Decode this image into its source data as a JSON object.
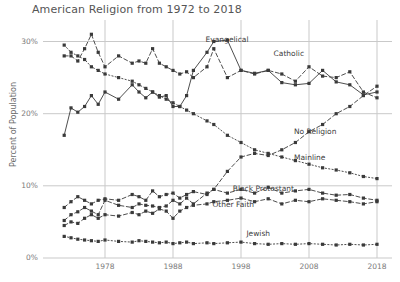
{
  "chart_data": {
    "type": "line",
    "title": "American Religion from 1972 to 2018",
    "xlabel": "",
    "ylabel": "Percent of Population",
    "xlim": [
      1972,
      2018
    ],
    "ylim": [
      0,
      32
    ],
    "grid": true,
    "legend_position": "inline-annotations",
    "yticks": [
      "0%",
      "10%",
      "20%",
      "30%"
    ],
    "ytick_values": [
      0,
      10,
      20,
      30
    ],
    "xticks": [
      "1978",
      "1988",
      "1998",
      "2008",
      "2018"
    ],
    "xtick_values": [
      1978,
      1988,
      1998,
      2008,
      2018
    ],
    "x": [
      1972,
      1973,
      1974,
      1975,
      1976,
      1977,
      1978,
      1980,
      1982,
      1983,
      1984,
      1985,
      1986,
      1987,
      1988,
      1989,
      1990,
      1991,
      1993,
      1994,
      1996,
      1998,
      2000,
      2002,
      2004,
      2006,
      2008,
      2010,
      2012,
      2014,
      2016,
      2018
    ],
    "series": [
      {
        "name": "Evangelical",
        "label_x": 1992.5,
        "label_y": 30.2,
        "style": "solid",
        "values": [
          17.0,
          20.8,
          20.2,
          21.0,
          22.5,
          21.3,
          23.0,
          22.0,
          24.0,
          23.0,
          22.2,
          23.0,
          22.3,
          22.5,
          21.0,
          21.0,
          22.5,
          26.0,
          28.5,
          30.0,
          30.2,
          26.0,
          25.6,
          26.0,
          24.3,
          24.0,
          24.2,
          26.0,
          24.4,
          24.0,
          22.6,
          23.0
        ]
      },
      {
        "name": "Catholic",
        "label_x": 2002.5,
        "label_y": 28.3,
        "style": "dashed",
        "values": [
          28.0,
          28.0,
          27.3,
          29.0,
          31.0,
          28.5,
          26.5,
          28.0,
          27.0,
          27.3,
          27.0,
          29.0,
          27.0,
          26.5,
          26.0,
          25.5,
          25.8,
          25.0,
          26.5,
          29.0,
          25.0,
          26.0,
          25.5,
          26.0,
          25.5,
          24.5,
          26.5,
          25.2,
          25.0,
          25.8,
          23.0,
          22.2
        ]
      },
      {
        "name": "No Religion",
        "label_x": 2005.5,
        "label_y": 17.5,
        "style": "dashed",
        "values": [
          5.2,
          6.0,
          6.4,
          7.0,
          6.5,
          6.0,
          8.0,
          7.3,
          7.0,
          7.5,
          7.3,
          7.2,
          7.0,
          7.2,
          8.0,
          7.5,
          8.3,
          7.5,
          9.0,
          9.5,
          12.0,
          14.0,
          14.5,
          14.2,
          15.0,
          16.0,
          17.5,
          18.5,
          20.0,
          21.0,
          22.5,
          23.8
        ]
      },
      {
        "name": "Mainline",
        "label_x": 2005.5,
        "label_y": 13.8,
        "style": "dotted",
        "values": [
          29.5,
          28.5,
          28.0,
          27.5,
          26.5,
          26.0,
          25.5,
          25.0,
          24.5,
          24.0,
          23.5,
          23.0,
          22.5,
          22.0,
          21.5,
          21.0,
          20.5,
          20.0,
          19.0,
          18.5,
          17.0,
          16.0,
          15.0,
          14.5,
          14.0,
          13.5,
          13.0,
          12.5,
          12.2,
          11.8,
          11.3,
          11.0
        ]
      },
      {
        "name": "Black Protestant",
        "label_x": 1996.5,
        "label_y": 9.6,
        "style": "dashed",
        "values": [
          7.0,
          7.8,
          8.5,
          8.0,
          7.5,
          8.0,
          8.2,
          8.0,
          8.8,
          8.5,
          8.0,
          9.3,
          8.5,
          8.8,
          9.0,
          8.3,
          8.8,
          9.2,
          8.8,
          9.5,
          9.0,
          9.5,
          9.0,
          9.8,
          9.0,
          9.3,
          9.5,
          9.0,
          8.7,
          8.8,
          8.3,
          8.0
        ]
      },
      {
        "name": "Other Faith",
        "label_x": 1993.5,
        "label_y": 7.3,
        "style": "dashed",
        "values": [
          4.5,
          5.0,
          4.8,
          5.5,
          6.0,
          5.5,
          6.0,
          5.8,
          6.3,
          6.0,
          6.5,
          6.2,
          6.8,
          6.5,
          5.5,
          6.5,
          7.0,
          7.3,
          7.5,
          7.8,
          8.0,
          8.3,
          7.8,
          8.2,
          7.5,
          8.0,
          7.8,
          8.2,
          8.0,
          7.8,
          7.5,
          7.8
        ]
      },
      {
        "name": "Jewish",
        "label_x": 1998.5,
        "label_y": 3.4,
        "style": "dotted",
        "values": [
          3.0,
          2.8,
          2.6,
          2.5,
          2.4,
          2.3,
          2.5,
          2.3,
          2.2,
          2.4,
          2.3,
          2.2,
          2.1,
          2.2,
          2.0,
          2.1,
          2.2,
          2.0,
          2.1,
          2.0,
          2.1,
          2.2,
          2.0,
          1.9,
          2.0,
          1.9,
          2.0,
          1.9,
          1.8,
          1.9,
          1.8,
          1.9
        ]
      }
    ],
    "colors": {
      "line": "#3a3a3a",
      "grid": "#c9c9c9",
      "text": "#5a5a5a",
      "background": "#ffffff"
    }
  }
}
